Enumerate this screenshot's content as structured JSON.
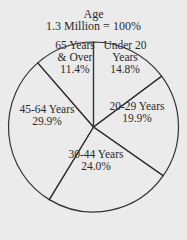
{
  "chart_data": {
    "type": "pie",
    "title": "Age",
    "subtitle": "1.3 Million = 100%",
    "categories": [
      "Under 20 Years",
      "20-29 Years",
      "30-44 Years",
      "45-64 Years",
      "65 Years & Over"
    ],
    "values": [
      14.8,
      19.9,
      24.0,
      29.9,
      11.4
    ],
    "unit": "%",
    "start_angle": "12 o'clock",
    "direction": "clockwise",
    "legend": "none (labels inside slices)",
    "slices": [
      {
        "label_lines": [
          "Under 20",
          "Years",
          "14.8%"
        ],
        "value": 14.8
      },
      {
        "label_lines": [
          "20-29 Years",
          "19.9%"
        ],
        "value": 19.9
      },
      {
        "label_lines": [
          "30-44 Years",
          "24.0%"
        ],
        "value": 24.0
      },
      {
        "label_lines": [
          "45-64 Years",
          "29.9%"
        ],
        "value": 29.9
      },
      {
        "label_lines": [
          "65 Years",
          "& Over",
          "11.4%"
        ],
        "value": 11.4
      }
    ]
  },
  "colors": {
    "background": "#ebebeb",
    "stroke": "#333333",
    "text": "#2a2a2a"
  }
}
